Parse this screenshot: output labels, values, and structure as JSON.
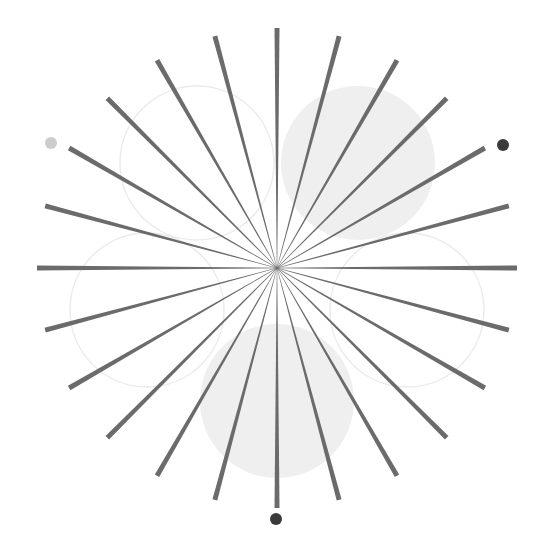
{
  "canvas": {
    "width": 552,
    "height": 546,
    "background": "#ffffff"
  },
  "starburst": {
    "center": [
      277,
      268
    ],
    "spoke_count": 24,
    "angle_step_deg": 15,
    "inner_radius": 0,
    "outer_radius": 240,
    "stroke_color": "#6b6b6b",
    "outer_width": 5,
    "inner_width": 0.4
  },
  "circles": [
    {
      "id": "top-left",
      "cx": 197,
      "cy": 163,
      "r": 77,
      "style": "outline",
      "fill": "none",
      "stroke": "#ebebeb"
    },
    {
      "id": "top-right",
      "cx": 358,
      "cy": 163,
      "r": 77,
      "style": "filled",
      "fill": "#efefef",
      "stroke": "none"
    },
    {
      "id": "left",
      "cx": 147,
      "cy": 310,
      "r": 77,
      "style": "outline",
      "fill": "none",
      "stroke": "#ebebeb"
    },
    {
      "id": "right",
      "cx": 407,
      "cy": 310,
      "r": 77,
      "style": "outline",
      "fill": "none",
      "stroke": "#ebebeb"
    },
    {
      "id": "bottom",
      "cx": 277,
      "cy": 401,
      "r": 77,
      "style": "filled",
      "fill": "#efefef",
      "stroke": "none"
    }
  ],
  "dots": [
    {
      "id": "upper-left-dot",
      "cx": 51,
      "cy": 143,
      "r": 6,
      "color": "#cccccc"
    },
    {
      "id": "upper-right-dot",
      "cx": 503,
      "cy": 145,
      "r": 6,
      "color": "#3a3a3a"
    },
    {
      "id": "bottom-dot",
      "cx": 276,
      "cy": 519,
      "r": 6,
      "color": "#3a3a3a"
    }
  ]
}
